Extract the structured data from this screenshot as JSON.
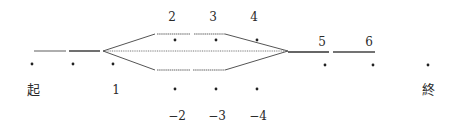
{
  "diagram": {
    "type": "path-branch-diagram",
    "line_color": "#555555",
    "dot_color": "#222222",
    "start_label": "起",
    "end_label": "終",
    "node_labels": {
      "n1": "1",
      "n2": "2",
      "n3": "3",
      "n4": "4",
      "n5": "5",
      "n6": "6",
      "n_minus2": "−2",
      "n_minus3": "−3",
      "n_minus4": "−4"
    },
    "branches": [
      "upper",
      "middle",
      "lower"
    ]
  }
}
